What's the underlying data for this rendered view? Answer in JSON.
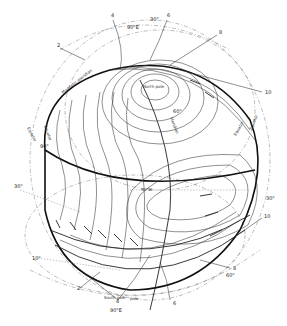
{
  "diagram": {
    "type": "spherical-projection-contour-diagram",
    "contour_labels": [
      "2",
      "4",
      "6",
      "8",
      "10",
      "12",
      "14",
      "16"
    ],
    "labels": {
      "top_numbers": [
        {
          "text": "2",
          "x": 57,
          "y": 47
        },
        {
          "text": "4",
          "x": 111,
          "y": 17
        },
        {
          "text": "6",
          "x": 167,
          "y": 17
        },
        {
          "text": "8",
          "x": 219,
          "y": 34
        },
        {
          "text": "10",
          "x": 267,
          "y": 94
        }
      ],
      "bottom_numbers": [
        {
          "text": "2",
          "x": 77,
          "y": 290
        },
        {
          "text": "4",
          "x": 116,
          "y": 303
        },
        {
          "text": "6",
          "x": 173,
          "y": 305
        },
        {
          "text": "8",
          "x": 233,
          "y": 270
        },
        {
          "text": "10",
          "x": 266,
          "y": 218
        }
      ],
      "lat_lon": [
        {
          "text": "30°",
          "x": 154,
          "y": 21
        },
        {
          "text": "90°E",
          "x": 131,
          "y": 28
        },
        {
          "text": "60°",
          "x": 175,
          "y": 113
        },
        {
          "text": "30°",
          "x": 268,
          "y": 200
        },
        {
          "text": "60°",
          "x": 228,
          "y": 277
        },
        {
          "text": "30°",
          "x": 16,
          "y": 188
        },
        {
          "text": "10°",
          "x": 34,
          "y": 260
        },
        {
          "text": "90°",
          "x": 41,
          "y": 148
        },
        {
          "text": "90°E",
          "x": 112,
          "y": 311
        },
        {
          "text": "North pole",
          "x": 145,
          "y": 88
        },
        {
          "text": "South pole",
          "x": 107,
          "y": 299
        },
        {
          "text": "pole",
          "x": 130,
          "y": 299
        },
        {
          "text": "90°W",
          "x": 143,
          "y": 191
        }
      ],
      "rotated": [
        {
          "text": "Magnetic meridian",
          "x": 63,
          "y": 94,
          "angle": -38
        },
        {
          "text": "Equator",
          "x": 27,
          "y": 134,
          "angle": 62
        },
        {
          "text": "Equator",
          "x": 44,
          "y": 132,
          "angle": 70
        },
        {
          "text": "Meridian",
          "x": 172,
          "y": 128,
          "angle": 68
        },
        {
          "text": "Equator",
          "x": 240,
          "y": 128,
          "angle": -60
        },
        {
          "text": "Equator",
          "x": 256,
          "y": 118,
          "angle": -68
        }
      ]
    },
    "colors": {
      "ink": "#222222",
      "background": "#ffffff",
      "dashed": "#777777"
    }
  }
}
